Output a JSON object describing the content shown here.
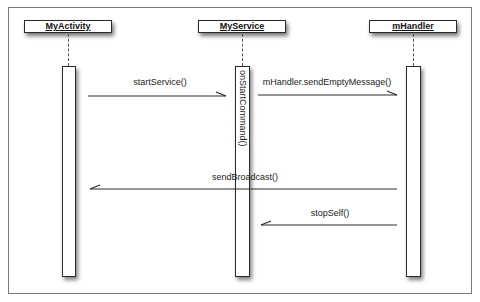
{
  "diagram": {
    "type": "sequence",
    "participants": [
      {
        "id": "activity",
        "label": "MyActivity"
      },
      {
        "id": "service",
        "label": "MyService"
      },
      {
        "id": "handler",
        "label": "mHandler"
      }
    ],
    "activation_labels": {
      "service": "onStartCommand()"
    },
    "messages": [
      {
        "from": "MyActivity",
        "to": "MyService",
        "label": "startService()",
        "direction": "right"
      },
      {
        "from": "MyService",
        "to": "mHandler",
        "label": "mHandler.sendEmptyMessage()",
        "direction": "right"
      },
      {
        "from": "mHandler",
        "to": "MyActivity",
        "label": "sendBroadcast()",
        "direction": "left"
      },
      {
        "from": "mHandler",
        "to": "MyService",
        "label": "stopSelf()",
        "direction": "left"
      }
    ],
    "colors": {
      "line": "#2a2a2a",
      "frame": "#7a7a7a",
      "background": "#ffffff"
    }
  }
}
